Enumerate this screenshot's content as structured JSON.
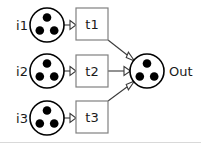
{
  "diagram": {
    "type": "petri-net",
    "background_color": "#ffffff",
    "stroke_color": "#000000",
    "transition_border_color": "#808080",
    "arc_color": "#3a3a3a",
    "token_color": "#000000",
    "border_color": "#d9d9d9",
    "input_places": [
      {
        "id": "i1",
        "label": "i1",
        "tokens": 3,
        "cx": 47,
        "cy": 25,
        "r": 17
      },
      {
        "id": "i2",
        "label": "i2",
        "tokens": 3,
        "cx": 47,
        "cy": 71,
        "r": 17
      },
      {
        "id": "i3",
        "label": "i3",
        "tokens": 3,
        "cx": 47,
        "cy": 118,
        "r": 17
      }
    ],
    "transitions": [
      {
        "id": "t1",
        "label": "t1",
        "x": 76,
        "y": 8,
        "w": 32,
        "h": 32
      },
      {
        "id": "t2",
        "label": "t2",
        "x": 76,
        "y": 55,
        "w": 32,
        "h": 32
      },
      {
        "id": "t3",
        "label": "t3",
        "x": 76,
        "y": 101,
        "w": 32,
        "h": 32
      }
    ],
    "output_place": {
      "id": "out",
      "label": "Out",
      "tokens": 3,
      "cx": 147,
      "cy": 71,
      "r": 17
    },
    "arcs": [
      {
        "id": "arc-i1-t1",
        "from": "i1",
        "to": "t1"
      },
      {
        "id": "arc-i2-t2",
        "from": "i2",
        "to": "t2"
      },
      {
        "id": "arc-i3-t3",
        "from": "i3",
        "to": "t3"
      },
      {
        "id": "arc-t1-out",
        "from": "t1",
        "to": "out"
      },
      {
        "id": "arc-t2-out",
        "from": "t2",
        "to": "out"
      },
      {
        "id": "arc-t3-out",
        "from": "t3",
        "to": "out"
      }
    ]
  }
}
